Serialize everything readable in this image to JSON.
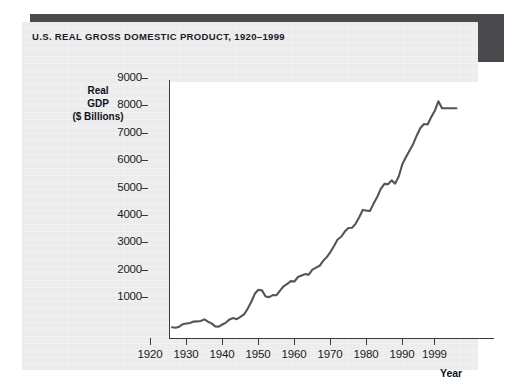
{
  "panel": {
    "title": "U.S. REAL GROSS DOMESTIC PRODUCT, 1920–1999",
    "background_color": "#ededed",
    "shadow_color": "#4a4a4e"
  },
  "chart_data": {
    "type": "line",
    "title": "U.S. REAL GROSS DOMESTIC PRODUCT, 1920–1999",
    "xlabel": "Year",
    "ylabel": "Real GDP ($ Billions)",
    "ylabel_lines": [
      "Real",
      "GDP",
      "($ Billions)"
    ],
    "xlim": [
      1920,
      1999
    ],
    "ylim": [
      0,
      9400
    ],
    "grid": false,
    "legend": null,
    "line_color": "#555555",
    "plot_background": "#ffffff",
    "xticks": [
      1920,
      1930,
      1940,
      1950,
      1960,
      1970,
      1980,
      1990,
      1999
    ],
    "xtick_labels": [
      "1920",
      "1930",
      "1940",
      "1950",
      "1960",
      "1970",
      "1980",
      "1990",
      "1999"
    ],
    "yticks": [
      1000,
      2000,
      3000,
      4000,
      5000,
      6000,
      7000,
      8000,
      9000
    ],
    "ytick_labels": [
      "1000",
      "2000",
      "3000",
      "4000",
      "5000",
      "6000",
      "7000",
      "8000",
      "9000"
    ],
    "series": [
      {
        "name": "Real GDP ($ Billions)",
        "x": [
          1920,
          1921,
          1922,
          1923,
          1924,
          1925,
          1926,
          1927,
          1928,
          1929,
          1930,
          1931,
          1932,
          1933,
          1934,
          1935,
          1936,
          1937,
          1938,
          1939,
          1940,
          1941,
          1942,
          1943,
          1944,
          1945,
          1946,
          1947,
          1948,
          1949,
          1950,
          1951,
          1952,
          1953,
          1954,
          1955,
          1956,
          1957,
          1958,
          1959,
          1960,
          1961,
          1962,
          1963,
          1964,
          1965,
          1966,
          1967,
          1968,
          1969,
          1970,
          1971,
          1972,
          1973,
          1974,
          1975,
          1976,
          1977,
          1978,
          1979,
          1980,
          1981,
          1982,
          1983,
          1984,
          1985,
          1986,
          1987,
          1988,
          1989,
          1990,
          1991,
          1992,
          1993,
          1994,
          1995,
          1996,
          1997,
          1998,
          1999
        ],
        "values": [
          690,
          672,
          709,
          800,
          825,
          845,
          900,
          905,
          915,
          975,
          890,
          832,
          724,
          714,
          792,
          862,
          975,
          1025,
          985,
          1065,
          1155,
          1355,
          1605,
          1905,
          2055,
          2035,
          1810,
          1790,
          1865,
          1855,
          2020,
          2180,
          2265,
          2370,
          2355,
          2520,
          2575,
          2625,
          2605,
          2790,
          2860,
          2930,
          3110,
          3245,
          3430,
          3650,
          3890,
          3990,
          4180,
          4310,
          4320,
          4460,
          4700,
          4970,
          4945,
          4935,
          5200,
          5440,
          5740,
          5920,
          5905,
          6050,
          5930,
          6200,
          6650,
          6900,
          7140,
          7380,
          7690,
          7960,
          8110,
          8090,
          8360,
          8590,
          8940,
          9160,
          9500,
          9930,
          10350,
          10800
        ],
        "values_note": "Read from the plotted curve; axis units are $ Billions. Endpoint at 1999 reads approximately 8700 on the printed scale.",
        "pixel_read_values": [
          700,
          680,
          720,
          810,
          835,
          855,
          905,
          915,
          925,
          985,
          900,
          840,
          730,
          720,
          800,
          870,
          985,
          1035,
          995,
          1075,
          1165,
          1370,
          1620,
          1920,
          2070,
          2045,
          1820,
          1800,
          1875,
          1865,
          2035,
          2195,
          2280,
          2385,
          2370,
          2535,
          2590,
          2640,
          2620,
          2805,
          2875,
          2945,
          3125,
          3260,
          3445,
          3665,
          3905,
          4005,
          4195,
          4325,
          4335,
          4475,
          4715,
          4985,
          4960,
          4950,
          5215,
          5455,
          5755,
          5935,
          5920,
          6065,
          5945,
          6215,
          6665,
          6915,
          7155,
          7395,
          7705,
          7975,
          8125,
          8105,
          8375,
          8605,
          8955,
          8700,
          8700,
          8700,
          8700,
          8700
        ]
      }
    ],
    "annotations": []
  }
}
